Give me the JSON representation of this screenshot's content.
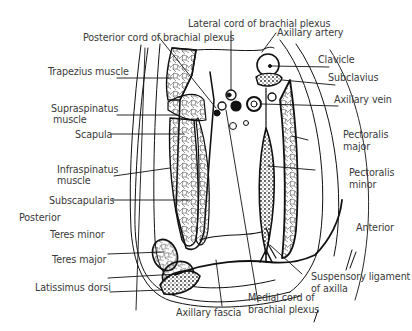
{
  "diagram": {
    "orientation": {
      "posterior": "Posterior",
      "anterior": "Anterior"
    },
    "labels": {
      "lateral_cord": "Lateral cord of brachial plexus",
      "posterior_cord": "Posterior cord of brachial plexus",
      "axillary_artery": "Axillary artery",
      "clavicle": "Clavicle",
      "subclavius": "Subclavius",
      "axillary_vein": "Axillary vein",
      "trapezius": "Trapezius muscle",
      "supraspinatus_1": "Supraspinatus",
      "supraspinatus_2": "muscle",
      "scapula": "Scapula",
      "infraspinatus_1": "Infraspinatus",
      "infraspinatus_2": "muscle",
      "subscapularis": "Subscapularis",
      "pectoralis_major_1": "Pectoralis",
      "pectoralis_major_2": "major",
      "pectoralis_minor_1": "Pectoralis",
      "pectoralis_minor_2": "minor",
      "teres_minor": "Teres minor",
      "teres_major": "Teres major",
      "latissimus_dorsi": "Latissimus dorsi",
      "axillary_fascia": "Axillary fascia",
      "medial_cord_1": "Medial cord of",
      "medial_cord_2": "brachial plexus",
      "suspensory_1": "Suspensory ligament",
      "suspensory_2": "of axilla"
    },
    "colors": {
      "line": "#111111",
      "text": "#3a3a3a",
      "background": "#ffffff"
    }
  }
}
